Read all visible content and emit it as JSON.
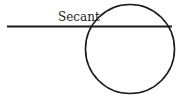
{
  "diagram": {
    "label": "Secant",
    "stroke_color": "#1a1a1a",
    "circle": {
      "cx": 130,
      "cy": 49,
      "r": 44.5
    },
    "secant_line": {
      "x1": 7,
      "y1": 26.5,
      "x2": 172,
      "y2": 26.5
    },
    "label_position": {
      "x": 58,
      "y": 21
    }
  }
}
